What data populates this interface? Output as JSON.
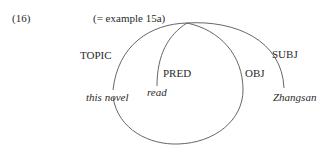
{
  "example": {
    "number": "(16)",
    "caption": "(= example 15a)"
  },
  "diagram": {
    "arcs": [
      {
        "label": "TOPIC",
        "target": "this novel"
      },
      {
        "label": "PRED",
        "target": "read"
      },
      {
        "label": "OBJ",
        "target": "this novel"
      },
      {
        "label": "SUBJ",
        "target": "Zhangsan"
      }
    ],
    "labels": {
      "topic": "TOPIC",
      "pred": "PRED",
      "obj": "OBJ",
      "subj": "SUBJ"
    },
    "words": {
      "this_novel": "this novel",
      "read": "read",
      "zhangsan": "Zhangsan"
    },
    "stroke_color": "#555555"
  }
}
